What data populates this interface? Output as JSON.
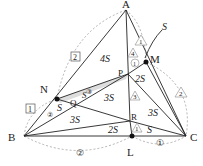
{
  "points": {
    "A": {
      "label": "A",
      "x": 126,
      "y": 10
    },
    "B": {
      "label": "B",
      "x": 24,
      "y": 136
    },
    "C": {
      "label": "C",
      "x": 186,
      "y": 136
    },
    "M": {
      "label": "M",
      "x": 146,
      "y": 62
    },
    "N": {
      "label": "N",
      "x": 57,
      "y": 99
    },
    "P": {
      "label": "P",
      "x": 128,
      "y": 74
    },
    "Q": {
      "label": "Q",
      "x": 76,
      "y": 98
    },
    "R": {
      "label": "R",
      "x": 130,
      "y": 121
    },
    "L": {
      "label": "L",
      "x": 132,
      "y": 136
    }
  },
  "areas": {
    "a1": "4S",
    "a2": "2S",
    "a3": "3S",
    "a4": "3S",
    "a5": "3S",
    "a6": "2S",
    "a7": "S",
    "a8": "S",
    "a9": "S",
    "a10": "S"
  },
  "ratio_marks": {
    "AN": "2",
    "NB": "1",
    "BL": "②",
    "LC": "①",
    "CM": "2",
    "MA": "1",
    "AP_tri": "4",
    "PM_c": "1",
    "PR_tri": "3",
    "RL_tri": "1",
    "NQ_c": "②",
    "QP_c": "③"
  },
  "colors": {
    "line": "#222222",
    "dashed": "#999999",
    "shade": "#bbbbbb"
  }
}
